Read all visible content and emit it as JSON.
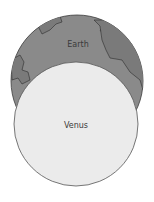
{
  "diagram": {
    "earth": {
      "label": "Earth",
      "fill": "#8a8a8a",
      "land_fill": "#787878",
      "stroke": "#3c3c3c"
    },
    "venus": {
      "label": "Venus",
      "fill": "#ebebeb",
      "stroke": "#555555"
    }
  }
}
